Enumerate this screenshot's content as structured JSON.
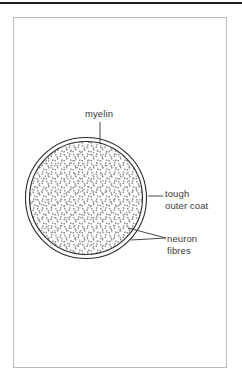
{
  "document": {
    "type": "diagram",
    "title": "Cross-section of a myelinated nerve",
    "background_color": "#ffffff"
  },
  "top_rule": {
    "color": "#1d1d1d"
  },
  "frame": {
    "border_color": "#b9b9b9"
  },
  "diagram": {
    "shape": "circle-cross-section",
    "center": {
      "x": 86,
      "y": 198
    },
    "outer_radius": 61,
    "inner_radius": 56,
    "ring_color": "#2b2b2b",
    "stipple_color": "#8c8c8c",
    "fill_color": "#ffffff",
    "leader_color": "#4a4a4a"
  },
  "labels": {
    "myelin": {
      "text": "myelin",
      "leader": "vertical-line-down"
    },
    "tough_outer_coat": {
      "line1": "tough",
      "line2": "outer coat",
      "leader": "horizontal-line-left"
    },
    "neuron_fibres": {
      "line1": "neuron",
      "line2": "fibres",
      "leader": "wedge-up-left"
    }
  }
}
